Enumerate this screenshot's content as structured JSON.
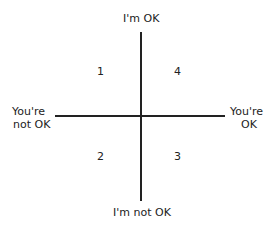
{
  "diagram": {
    "axes": {
      "top": "I'm OK",
      "bottom": "I'm not OK",
      "left": [
        "You're",
        "not OK"
      ],
      "right": [
        "You're",
        "OK"
      ]
    },
    "quadrants": {
      "top_left": "1",
      "top_right": "4",
      "bottom_left": "2",
      "bottom_right": "3"
    }
  }
}
